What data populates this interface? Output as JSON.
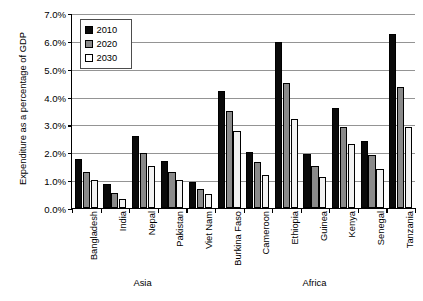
{
  "chart_data": {
    "type": "bar",
    "title": "",
    "subtitle": "",
    "xlabel": "",
    "ylabel": "Expenditure as a percentage of GDP",
    "ylim": [
      0,
      7
    ],
    "ytick_values": [
      0,
      1,
      2,
      3,
      4,
      5,
      6,
      7
    ],
    "ytick_labels": [
      "0.0%",
      "1.0%",
      "2.0%",
      "3.0%",
      "4.0%",
      "5.0%",
      "6.0%",
      "7.0%"
    ],
    "grid": true,
    "legend_position": "upper-left-inside",
    "categories": [
      "Bangladesh",
      "India",
      "Nepal",
      "Pakistan",
      "Viet Nam",
      "Burkina Faso",
      "Cameroon",
      "Ethiopia",
      "Guinea",
      "Kenya",
      "Senegal",
      "Tanzania"
    ],
    "series": [
      {
        "name": "2010",
        "color": "#0a0a0a",
        "values": [
          1.75,
          0.85,
          2.6,
          1.68,
          0.92,
          4.2,
          2.0,
          5.95,
          1.95,
          3.6,
          2.4,
          6.25
        ]
      },
      {
        "name": "2020",
        "color": "#8a8a8a",
        "values": [
          1.3,
          0.55,
          1.98,
          1.3,
          0.68,
          3.5,
          1.65,
          4.5,
          1.5,
          2.9,
          1.9,
          4.35
        ]
      },
      {
        "name": "2030",
        "color": "#f2f2f2",
        "values": [
          1.0,
          0.33,
          1.5,
          1.0,
          0.5,
          2.75,
          1.2,
          3.2,
          1.1,
          2.3,
          1.4,
          2.9
        ]
      }
    ],
    "group_annotations": [
      {
        "label": "Asia",
        "start_category": "Bangladesh",
        "end_category": "Viet Nam"
      },
      {
        "label": "Africa",
        "start_category": "Burkina Faso",
        "end_category": "Tanzania"
      }
    ]
  },
  "legend": {
    "items": [
      {
        "label": "2010"
      },
      {
        "label": "2020"
      },
      {
        "label": "2030"
      }
    ]
  }
}
